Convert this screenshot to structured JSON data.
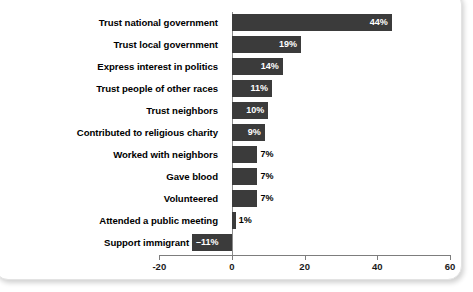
{
  "chart_data": {
    "type": "bar",
    "orientation": "horizontal",
    "title": "",
    "subtitle": "",
    "xlabel": "",
    "ylabel": "",
    "xlim": [
      -20,
      60
    ],
    "xticks": [
      -20,
      0,
      20,
      40,
      60
    ],
    "xtick_labels": [
      "-20",
      "0",
      "20",
      "40",
      "60"
    ],
    "grid": false,
    "legend": null,
    "value_suffix": "%",
    "bar_color": "#3b3b3b",
    "label_color_inside": "#ffffff",
    "label_color_outside": "#000000",
    "categories": [
      "Trust national government",
      "Trust local government",
      "Express interest in politics",
      "Trust people of other races",
      "Trust neighbors",
      "Contributed to religious charity",
      "Worked with neighbors",
      "Gave blood",
      "Volunteered",
      "Attended a public meeting",
      "Support immigrant rights"
    ],
    "values": [
      44,
      19,
      14,
      11,
      10,
      9,
      7,
      7,
      7,
      1,
      -11
    ],
    "data_labels": [
      "44%",
      "19%",
      "14%",
      "11%",
      "10%",
      "9%",
      "7%",
      "7%",
      "7%",
      "1%",
      "–11%"
    ],
    "points": [
      {
        "category": "Trust national government",
        "value": 44,
        "label": "44%"
      },
      {
        "category": "Trust local government",
        "value": 19,
        "label": "19%"
      },
      {
        "category": "Express interest in politics",
        "value": 14,
        "label": "14%"
      },
      {
        "category": "Trust people of other races",
        "value": 11,
        "label": "11%"
      },
      {
        "category": "Trust neighbors",
        "value": 10,
        "label": "10%"
      },
      {
        "category": "Contributed to religious charity",
        "value": 9,
        "label": "9%"
      },
      {
        "category": "Worked with neighbors",
        "value": 7,
        "label": "7%"
      },
      {
        "category": "Gave blood",
        "value": 7,
        "label": "7%"
      },
      {
        "category": "Volunteered",
        "value": 7,
        "label": "7%"
      },
      {
        "category": "Attended a public meeting",
        "value": 1,
        "label": "1%"
      },
      {
        "category": "Support immigrant rights",
        "value": -11,
        "label": "–11%"
      }
    ]
  }
}
